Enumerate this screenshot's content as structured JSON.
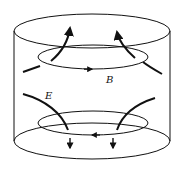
{
  "diagram": {
    "labels": {
      "b_field": "B",
      "e_field": "E"
    },
    "colors": {
      "stroke": "#111111",
      "background": "#ffffff"
    }
  }
}
